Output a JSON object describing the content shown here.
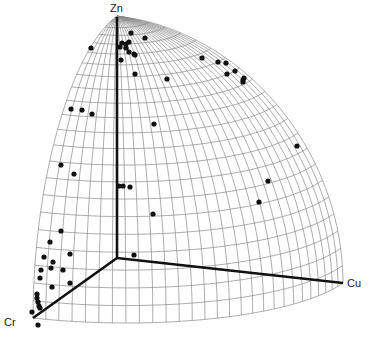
{
  "chart_data": {
    "type": "scatter",
    "subtype": "3d-sphere-octant",
    "title": "",
    "axes": {
      "vertical": "Zn",
      "left_front": "Cr",
      "right": "Cu"
    },
    "grid": true,
    "legend": null,
    "colors": {
      "points": "#111111",
      "grid": "#8a8a8a",
      "axes": "#111111",
      "background": "#ffffff"
    },
    "points_px": [
      [
        91,
        48
      ],
      [
        131,
        33
      ],
      [
        145,
        38
      ],
      [
        122,
        43
      ],
      [
        126,
        44
      ],
      [
        129,
        42
      ],
      [
        120,
        47
      ],
      [
        126,
        48
      ],
      [
        129,
        52
      ],
      [
        134,
        54
      ],
      [
        135,
        55
      ],
      [
        121,
        60
      ],
      [
        135,
        74
      ],
      [
        167,
        79
      ],
      [
        202,
        58
      ],
      [
        218,
        62
      ],
      [
        226,
        63
      ],
      [
        227,
        74
      ],
      [
        235,
        71
      ],
      [
        243,
        80
      ],
      [
        244,
        78
      ],
      [
        243,
        82
      ],
      [
        71,
        109
      ],
      [
        82,
        110
      ],
      [
        92,
        114
      ],
      [
        154,
        124
      ],
      [
        297,
        146
      ],
      [
        268,
        181
      ],
      [
        259,
        202
      ],
      [
        61,
        165
      ],
      [
        74,
        174
      ],
      [
        119,
        186
      ],
      [
        123,
        186
      ],
      [
        130,
        187
      ],
      [
        153,
        214
      ],
      [
        61,
        231
      ],
      [
        50,
        242
      ],
      [
        44,
        257
      ],
      [
        53,
        262
      ],
      [
        70,
        254
      ],
      [
        41,
        270
      ],
      [
        51,
        268
      ],
      [
        63,
        270
      ],
      [
        40,
        278
      ],
      [
        52,
        287
      ],
      [
        70,
        283
      ],
      [
        134,
        255
      ],
      [
        37,
        294
      ],
      [
        37,
        298
      ],
      [
        38,
        302
      ],
      [
        39,
        306
      ],
      [
        40,
        308
      ],
      [
        32,
        312
      ],
      [
        38,
        325
      ]
    ]
  },
  "labels": {
    "zn": "Zn",
    "cr": "Cr",
    "cu": "Cu"
  }
}
